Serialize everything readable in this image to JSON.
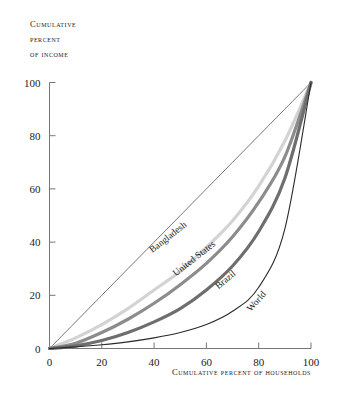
{
  "figure": {
    "background_color": "#ffffff",
    "y_axis_title_lines": [
      "Cumulative",
      "percent",
      "of income"
    ],
    "x_axis_title": "Cumulative percent of households"
  },
  "chart_data": {
    "type": "line",
    "title": "",
    "subtitle": "",
    "xlabel": "Cumulative percent of households",
    "ylabel": "Cumulative percent of income",
    "xlim": [
      0,
      100
    ],
    "ylim": [
      0,
      100
    ],
    "xticks": [
      0,
      20,
      40,
      60,
      80,
      100
    ],
    "yticks": [
      0,
      20,
      40,
      60,
      80,
      100
    ],
    "xtick_labels": [
      "0",
      "20",
      "40",
      "60",
      "80",
      "100"
    ],
    "ytick_labels": [
      "0",
      "20",
      "40",
      "60",
      "80",
      "100"
    ],
    "grid": false,
    "legend": "inline-curve-labels",
    "annotations": [
      "Bangladesh",
      "United States",
      "Brazil",
      "World"
    ],
    "series": [
      {
        "name": "Line of equality",
        "color": "#3d3d3d",
        "width": 0.7,
        "labelled": false,
        "x": [
          0,
          10,
          20,
          30,
          40,
          50,
          60,
          70,
          80,
          90,
          100
        ],
        "values": [
          0,
          10,
          20,
          30,
          40,
          50,
          60,
          70,
          80,
          90,
          100
        ]
      },
      {
        "name": "Bangladesh",
        "color": "#d3d3d3",
        "width": 3.2,
        "labelled": true,
        "label_x": 46,
        "label_y": 41,
        "label_angle": -38,
        "x": [
          0,
          10,
          20,
          30,
          40,
          50,
          60,
          70,
          80,
          90,
          100
        ],
        "values": [
          0,
          4,
          9,
          15,
          22,
          29,
          38,
          48,
          61,
          78,
          100
        ]
      },
      {
        "name": "United States",
        "color": "#8c8c8c",
        "width": 3.2,
        "labelled": true,
        "label_x": 56,
        "label_y": 33,
        "label_angle": -38,
        "x": [
          0,
          10,
          20,
          30,
          40,
          50,
          60,
          70,
          80,
          90,
          100
        ],
        "values": [
          0,
          2,
          6,
          11,
          17,
          24,
          32,
          42,
          55,
          72,
          100
        ]
      },
      {
        "name": "Brazil",
        "color": "#6e6e6e",
        "width": 3.2,
        "labelled": true,
        "label_x": 68,
        "label_y": 25,
        "label_angle": -40,
        "x": [
          0,
          10,
          20,
          30,
          40,
          50,
          60,
          70,
          80,
          90,
          100
        ],
        "values": [
          0,
          1,
          3,
          6,
          10,
          15,
          22,
          31,
          44,
          64,
          100
        ]
      },
      {
        "name": "World",
        "color": "#2b2b2b",
        "width": 1.1,
        "labelled": true,
        "label_x": 80,
        "label_y": 17,
        "label_angle": -48,
        "x": [
          0,
          10,
          20,
          30,
          40,
          50,
          60,
          70,
          80,
          90,
          100
        ],
        "values": [
          0,
          0.6,
          1.4,
          2.5,
          4.0,
          6.0,
          9.0,
          14.0,
          23.0,
          45.0,
          100
        ]
      }
    ]
  }
}
